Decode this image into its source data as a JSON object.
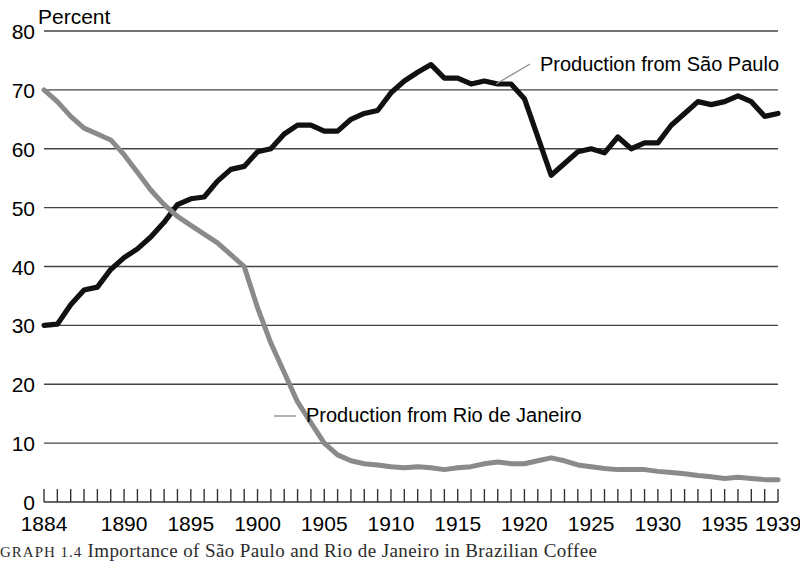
{
  "chart_data": {
    "type": "line",
    "title": "",
    "xlabel": "",
    "ylabel": "Percent",
    "ylim": [
      0,
      80
    ],
    "xlim": [
      1884,
      1939
    ],
    "ytick_values": [
      0,
      10,
      20,
      30,
      40,
      50,
      60,
      70,
      80
    ],
    "ytick_labels": [
      "0",
      "10",
      "20",
      "30",
      "40",
      "50",
      "60",
      "70",
      "80"
    ],
    "xtick_labels": [
      "1884",
      "1890",
      "1895",
      "1900",
      "1905",
      "1910",
      "1915",
      "1920",
      "1925",
      "1930",
      "1935",
      "1939"
    ],
    "xtick_label_years": [
      1884,
      1890,
      1895,
      1900,
      1905,
      1910,
      1915,
      1920,
      1925,
      1930,
      1935,
      1939
    ],
    "grid": "horizontal",
    "legend_position": "inline-annotations",
    "x": [
      1884,
      1885,
      1886,
      1887,
      1888,
      1889,
      1890,
      1891,
      1892,
      1893,
      1894,
      1895,
      1896,
      1897,
      1898,
      1899,
      1900,
      1901,
      1902,
      1903,
      1904,
      1905,
      1906,
      1907,
      1908,
      1909,
      1910,
      1911,
      1912,
      1913,
      1914,
      1915,
      1916,
      1917,
      1918,
      1919,
      1920,
      1921,
      1922,
      1923,
      1924,
      1925,
      1926,
      1927,
      1928,
      1929,
      1930,
      1931,
      1932,
      1933,
      1934,
      1935,
      1936,
      1937,
      1938,
      1939
    ],
    "series": [
      {
        "name": "Production from São Paulo",
        "color": "#111111",
        "values": [
          30.0,
          30.2,
          33.5,
          36.0,
          36.5,
          39.5,
          41.5,
          43.0,
          45.0,
          47.5,
          50.5,
          51.5,
          51.8,
          54.5,
          56.5,
          57.0,
          59.5,
          60.0,
          62.5,
          64.0,
          64.0,
          63.0,
          63.0,
          65.0,
          66.0,
          66.5,
          69.5,
          71.5,
          73.0,
          74.3,
          72.0,
          72.0,
          71.0,
          71.5,
          71.0,
          71.0,
          68.5,
          62.0,
          55.5,
          57.5,
          59.5,
          60.0,
          59.3,
          62.0,
          60.0,
          61.0,
          61.0,
          64.0,
          66.0,
          68.0,
          67.5,
          68.0,
          69.0,
          68.0,
          65.5,
          66.0
        ]
      },
      {
        "name": "Production from Rio de Janeiro",
        "color": "#8a8a8a",
        "values": [
          70.0,
          68.0,
          65.5,
          63.5,
          62.5,
          61.5,
          59.0,
          56.0,
          53.0,
          50.5,
          48.5,
          47.0,
          45.5,
          44.0,
          42.0,
          40.0,
          33.0,
          27.0,
          22.0,
          17.0,
          13.5,
          10.0,
          8.0,
          7.0,
          6.5,
          6.3,
          6.0,
          5.8,
          6.0,
          5.8,
          5.5,
          5.8,
          6.0,
          6.5,
          6.8,
          6.5,
          6.5,
          7.0,
          7.5,
          7.0,
          6.3,
          6.0,
          5.7,
          5.5,
          5.5,
          5.5,
          5.2,
          5.0,
          4.8,
          4.5,
          4.3,
          4.0,
          4.2,
          4.0,
          3.8,
          3.8
        ]
      }
    ],
    "annotations": [
      {
        "text": "Production from São Paulo",
        "target_year": 1916,
        "target_value": 71.0
      },
      {
        "text": "Production from Rio de Janeiro",
        "target_year": 1904,
        "target_value": 15.0
      }
    ]
  },
  "axis": {
    "y_axis_title": "Percent"
  },
  "caption": {
    "label": "GRAPH 1.4",
    "text": "Importance of São Paulo and Rio de Janeiro in Brazilian Coffee"
  }
}
